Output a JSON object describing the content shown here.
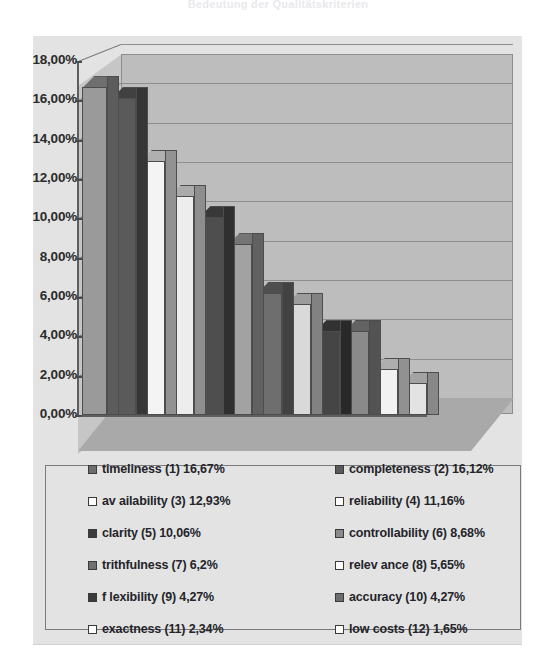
{
  "title_strip": "Bedeutung der Qualitätskriterien",
  "chart_object": {
    "background": "#e3e3e3",
    "plot_wall_color": "#bdbdbd",
    "floor_color": "#a9a9a9"
  },
  "chart_data": {
    "type": "bar",
    "title": "",
    "xlabel": "",
    "ylabel": "",
    "ylim": [
      0,
      18
    ],
    "grid": true,
    "legend_position": "bottom",
    "tick_labels": [
      "0,00%",
      "2,00%",
      "4,00%",
      "6,00%",
      "8,00%",
      "10,00%",
      "12,00%",
      "14,00%",
      "16,00%",
      "18,00%"
    ],
    "tick_values": [
      0,
      2,
      4,
      6,
      8,
      10,
      12,
      14,
      16,
      18
    ],
    "categories": [
      "timeliness (1)",
      "completeness (2)",
      "availability (3)",
      "reliability (4)",
      "clarity (5)",
      "controllability (6)",
      "trithfulness (7)",
      "relevance (8)",
      "flexibility (9)",
      "accuracy (10)",
      "exactness (11)",
      "low costs (12)"
    ],
    "values": [
      16.67,
      16.12,
      12.93,
      11.16,
      10.06,
      8.68,
      6.2,
      5.65,
      4.27,
      4.27,
      2.34,
      1.65
    ],
    "value_labels": [
      "16,67%",
      "16,12%",
      "12,93%",
      "11,16%",
      "10,06%",
      "8,68%",
      "6,2%",
      "5,65%",
      "4,27%",
      "4,27%",
      "2,34%",
      "1,65%"
    ],
    "bar_colors": [
      "#9a9a9a",
      "#5a5a5a",
      "#f4f4f4",
      "#ededed",
      "#4e4e4e",
      "#a2a2a2",
      "#6e6e6e",
      "#d9d9d9",
      "#454545",
      "#8a8a8a",
      "#f2f2f2",
      "#e3e3e3"
    ]
  },
  "legend": {
    "items": [
      {
        "label": "timeliness  (1) 16,67%",
        "swatch": "#6e6e6e",
        "marker": "filled-square-icon"
      },
      {
        "label": "completeness (2) 16,12%",
        "swatch": "#5a5a5a",
        "marker": "filled-square-icon"
      },
      {
        "label": "av ailability  (3) 12,93%",
        "swatch": "#ffffff",
        "marker": "open-square-icon"
      },
      {
        "label": "reliability  (4) 11,16%",
        "swatch": "#ffffff",
        "marker": "open-square-icon"
      },
      {
        "label": "clarity  (5) 10,06%",
        "swatch": "#3c3c3c",
        "marker": "filled-square-icon"
      },
      {
        "label": "controllability  (6) 8,68%",
        "swatch": "#8a8a8a",
        "marker": "filled-square-icon"
      },
      {
        "label": "trithfulness (7) 6,2%",
        "swatch": "#707070",
        "marker": "filled-square-icon"
      },
      {
        "label": "relev ance (8) 5,65%",
        "swatch": "#ffffff",
        "marker": "open-square-icon"
      },
      {
        "label": "f lexibility  (9) 4,27%",
        "swatch": "#3c3c3c",
        "marker": "filled-square-icon"
      },
      {
        "label": "accuracy  (10) 4,27%",
        "swatch": "#6e6e6e",
        "marker": "filled-square-icon"
      },
      {
        "label": "exactness (11) 2,34%",
        "swatch": "#ffffff",
        "marker": "open-square-icon"
      },
      {
        "label": "low costs (12) 1,65%",
        "swatch": "#ffffff",
        "marker": "open-square-icon"
      }
    ]
  }
}
